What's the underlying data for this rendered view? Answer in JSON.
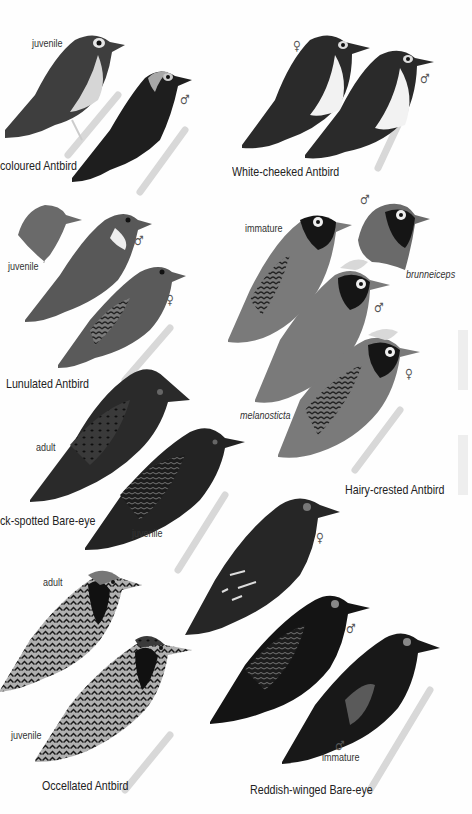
{
  "plate": {
    "background": "#fefefe",
    "species": [
      {
        "id": "bicoloured-antbird",
        "name": "coloured Antbird",
        "figures": [
          {
            "label": "juvenile"
          },
          {
            "label": "♂"
          }
        ]
      },
      {
        "id": "white-cheeked-antbird",
        "name": "White-cheeked Antbird",
        "figures": [
          {
            "label": "♀"
          },
          {
            "label": "♂"
          }
        ]
      },
      {
        "id": "lunulated-antbird",
        "name": "Lunulated Antbird",
        "figures": [
          {
            "label": "juvenile"
          },
          {
            "label": "♂"
          },
          {
            "label": "♀"
          }
        ]
      },
      {
        "id": "hairy-crested-antbird",
        "name": "Hairy-crested Antbird",
        "figures": [
          {
            "label": "immature"
          },
          {
            "label": "♂",
            "subspecies": "brunneiceps"
          },
          {
            "label": "♂",
            "subspecies": "melanosticta"
          },
          {
            "label": "♀"
          }
        ],
        "subspecies_labels": [
          "brunneiceps",
          "melanosticta"
        ]
      },
      {
        "id": "black-spotted-bare-eye",
        "name": "ck-spotted Bare-eye",
        "figures": [
          {
            "label": "adult"
          },
          {
            "label": "juvenile"
          }
        ]
      },
      {
        "id": "occellated-antbird",
        "name": "Occellated Antbird",
        "figures": [
          {
            "label": "adult"
          },
          {
            "label": "juvenile"
          }
        ]
      },
      {
        "id": "reddish-winged-bare-eye",
        "name": "Reddish-winged Bare-eye",
        "figures": [
          {
            "label": "♀"
          },
          {
            "label": "♂"
          },
          {
            "label": "♂",
            "sublabel": "immature"
          }
        ]
      }
    ]
  }
}
